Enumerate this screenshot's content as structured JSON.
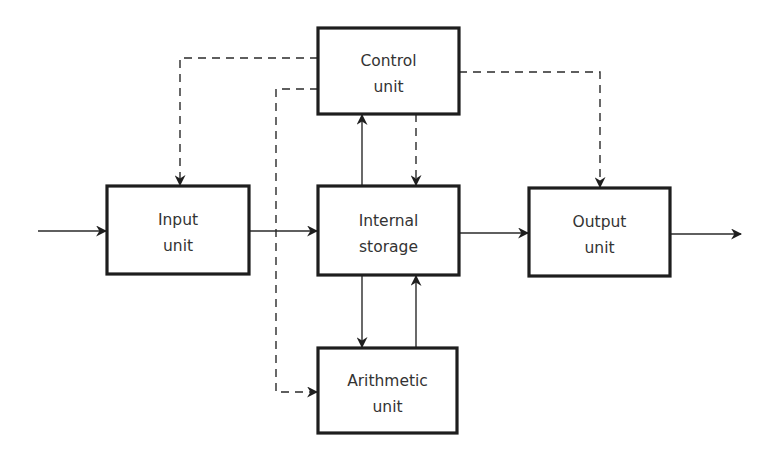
{
  "diagram": {
    "type": "computer-architecture-block-diagram",
    "colors": {
      "stroke": "#1e1e1e",
      "text": "#333333",
      "background": "#ffffff"
    },
    "boxes": [
      {
        "id": "control",
        "line1": "Control",
        "line2": "unit"
      },
      {
        "id": "input",
        "line1": "Input",
        "line2": "unit"
      },
      {
        "id": "storage",
        "line1": "Internal",
        "line2": "storage"
      },
      {
        "id": "output",
        "line1": "Output",
        "line2": "unit"
      },
      {
        "id": "arithmetic",
        "line1": "Arithmetic",
        "line2": "unit"
      }
    ],
    "connections": [
      {
        "from": "external",
        "to": "input",
        "style": "solid"
      },
      {
        "from": "input",
        "to": "storage",
        "style": "solid"
      },
      {
        "from": "storage",
        "to": "output",
        "style": "solid"
      },
      {
        "from": "output",
        "to": "external",
        "style": "solid"
      },
      {
        "from": "storage",
        "to": "control",
        "style": "solid"
      },
      {
        "from": "control",
        "to": "storage",
        "style": "dashed"
      },
      {
        "from": "storage",
        "to": "arithmetic",
        "style": "solid"
      },
      {
        "from": "arithmetic",
        "to": "storage",
        "style": "solid"
      },
      {
        "from": "control",
        "to": "input",
        "style": "dashed"
      },
      {
        "from": "control",
        "to": "output",
        "style": "dashed"
      },
      {
        "from": "control",
        "to": "arithmetic",
        "style": "dashed"
      }
    ]
  }
}
